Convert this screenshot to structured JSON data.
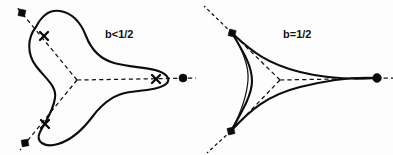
{
  "figure": {
    "background_color": "#fdfdfd",
    "stroke_color": "#0d0d0d",
    "panels": [
      {
        "id": "left",
        "label": "b<1/2",
        "label_position": {
          "x": 105,
          "y": 28
        },
        "description": "smooth rounded trefoil curve with three lobes",
        "center": {
          "x": 77,
          "y": 80
        },
        "cusp_type": "rounded",
        "marker_glyph": "x",
        "endpoint_markers": [
          {
            "name": "upper-left-square-dot",
            "shape": "square",
            "x": 22,
            "y": 13,
            "size": 5.2
          },
          {
            "name": "lower-left-square-dot",
            "shape": "square",
            "x": 25,
            "y": 143,
            "size": 5.2
          },
          {
            "name": "right-round-dot",
            "shape": "circle",
            "x": 183,
            "y": 78,
            "size": 4.0
          }
        ],
        "x_markers": [
          {
            "name": "x-marker-upper-left",
            "x": 44,
            "y": 36
          },
          {
            "name": "x-marker-lower-left",
            "x": 45,
            "y": 124
          },
          {
            "name": "x-marker-right",
            "x": 156,
            "y": 79
          }
        ],
        "axis_rays": [
          {
            "name": "ray-upper-left",
            "from": {
              "x": 77,
              "y": 80
            },
            "to": {
              "x": 22,
              "y": 13
            }
          },
          {
            "name": "ray-lower-left",
            "from": {
              "x": 77,
              "y": 80
            },
            "to": {
              "x": 25,
              "y": 143
            }
          },
          {
            "name": "ray-right",
            "from": {
              "x": 77,
              "y": 80
            },
            "to": {
              "x": 196,
              "y": 78
            }
          }
        ]
      },
      {
        "id": "right",
        "label": "b=1/2",
        "label_position": {
          "x": 283,
          "y": 28
        },
        "description": "deltoid hypocycloid with three sharp cusps",
        "center": {
          "x": 280,
          "y": 80
        },
        "cusp_type": "sharp",
        "marker_glyph": "none",
        "endpoint_markers": [
          {
            "name": "upper-left-cusp-dot",
            "shape": "square",
            "x": 232,
            "y": 33,
            "size": 5.6
          },
          {
            "name": "lower-left-cusp-dot",
            "shape": "square",
            "x": 231,
            "y": 131,
            "size": 5.6
          },
          {
            "name": "right-cusp-dot",
            "shape": "circle",
            "x": 377,
            "y": 78,
            "size": 4.4
          }
        ],
        "x_markers": [],
        "axis_rays": [
          {
            "name": "ray-upper-left",
            "from": {
              "x": 280,
              "y": 80
            },
            "to": {
              "x": 232,
              "y": 33
            }
          },
          {
            "name": "ray-lower-left",
            "from": {
              "x": 280,
              "y": 80
            },
            "to": {
              "x": 231,
              "y": 131
            }
          },
          {
            "name": "ray-right",
            "from": {
              "x": 280,
              "y": 80
            },
            "to": {
              "x": 390,
              "y": 78
            }
          }
        ],
        "extension_lines": [
          {
            "name": "extension-upper-left",
            "from": {
              "x": 232,
              "y": 33
            },
            "to": {
              "x": 205,
              "y": 7
            }
          },
          {
            "name": "extension-lower-left",
            "from": {
              "x": 231,
              "y": 131
            },
            "to": {
              "x": 208,
              "y": 152
            }
          }
        ]
      }
    ]
  }
}
